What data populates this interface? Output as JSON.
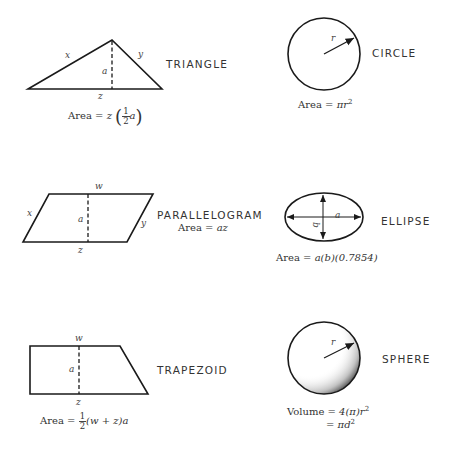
{
  "shapes": {
    "triangle": {
      "name": "TRIANGLE",
      "labels": {
        "x": "x",
        "y": "y",
        "a": "a",
        "z": "z"
      },
      "formula": {
        "prefix": "Area = ",
        "var": "z",
        "frac_num": "1",
        "frac_den": "2",
        "frac_var": "a"
      }
    },
    "circle": {
      "name": "CIRCLE",
      "labels": {
        "r": "r"
      },
      "formula": {
        "prefix": "Area = ",
        "expr": "πr",
        "exp": "2"
      }
    },
    "parallelogram": {
      "name": "PARALLELOGRAM",
      "labels": {
        "w": "w",
        "x": "x",
        "y": "y",
        "a": "a",
        "z": "z"
      },
      "formula": {
        "prefix": "Area = ",
        "expr": "az"
      }
    },
    "ellipse": {
      "name": "ELLIPSE",
      "labels": {
        "a": "a",
        "b": "b"
      },
      "formula": {
        "prefix": "Area = ",
        "expr": "a(b)(0.7854)"
      }
    },
    "trapezoid": {
      "name": "TRAPEZOID",
      "labels": {
        "w": "w",
        "a": "a",
        "z": "z"
      },
      "formula": {
        "prefix": "Area = ",
        "frac_num": "1",
        "frac_den": "2",
        "expr": "(w + z)a"
      }
    },
    "sphere": {
      "name": "SPHERE",
      "labels": {
        "r": "r"
      },
      "formula": {
        "line1_prefix": "Volume = ",
        "line1_expr": "4(π)r",
        "line1_exp": "2",
        "line2_prefix": "= ",
        "line2_expr": "πd",
        "line2_exp": "2"
      }
    }
  },
  "colors": {
    "stroke": "#1a1a1a",
    "text": "#333333",
    "background": "#ffffff"
  }
}
